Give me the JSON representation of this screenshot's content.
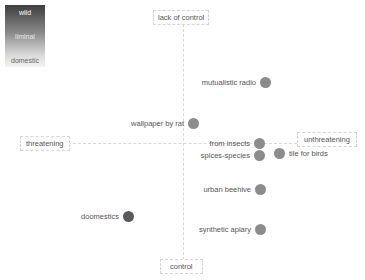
{
  "legend": {
    "title": "",
    "items": [
      {
        "label": "wild"
      },
      {
        "label": "liminal"
      },
      {
        "label": "domestic"
      }
    ],
    "gradient": {
      "top": "#3e3e3e",
      "bottom": "#f4f4f4"
    }
  },
  "axes": {
    "top": "lack of control",
    "bottom": "control",
    "left": "threatening",
    "right": "unthreatening"
  },
  "points": [
    {
      "label": "mutualistic radio",
      "x": 265,
      "y": 82,
      "color": "#8c8c8c"
    },
    {
      "label": "wallpaper by rat",
      "x": 193,
      "y": 123,
      "color": "#8c8c8c"
    },
    {
      "label": "from insects",
      "x": 259,
      "y": 143,
      "color": "#8c8c8c"
    },
    {
      "label": "spices-species",
      "x": 259,
      "y": 155,
      "color": "#8c8c8c"
    },
    {
      "label": "tile for birds",
      "x": 280,
      "y": 153,
      "color": "#8c8c8c"
    },
    {
      "label": "urban beehive",
      "x": 260,
      "y": 189,
      "color": "#8c8c8c"
    },
    {
      "label": "doomestics",
      "x": 128,
      "y": 216,
      "color": "#5a5a5a"
    },
    {
      "label": "synthetic apiary",
      "x": 260,
      "y": 229,
      "color": "#8c8c8c"
    }
  ]
}
